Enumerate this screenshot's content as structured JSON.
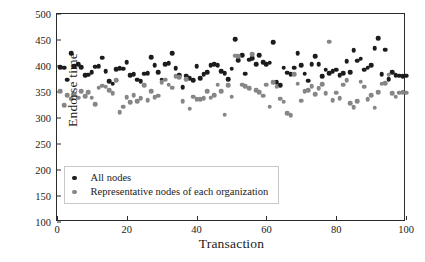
{
  "chart_data": {
    "type": "scatter",
    "title": "",
    "xlabel": "Transaction",
    "ylabel": "Endorse time",
    "xlim": [
      0,
      100
    ],
    "ylim": [
      100,
      500
    ],
    "xticks": [
      0,
      20,
      40,
      60,
      80,
      100
    ],
    "yticks": [
      100,
      150,
      200,
      250,
      300,
      350,
      400,
      450,
      500
    ],
    "grid": false,
    "legend_position": "lower-left-inside",
    "colors": {
      "all_nodes": "#1c1c1c",
      "representative_nodes": "#868686",
      "axis": "#2b2b2b",
      "background": "#ffffff"
    },
    "series": [
      {
        "name": "All nodes",
        "marker": "circle",
        "color": "#1c1c1c",
        "x": [
          1,
          2,
          3,
          4,
          5,
          6,
          7,
          8,
          9,
          10,
          11,
          12,
          13,
          14,
          15,
          16,
          17,
          18,
          19,
          20,
          21,
          22,
          23,
          24,
          25,
          26,
          27,
          28,
          29,
          30,
          31,
          32,
          33,
          34,
          35,
          36,
          37,
          38,
          39,
          40,
          41,
          42,
          43,
          44,
          45,
          46,
          47,
          48,
          49,
          50,
          51,
          52,
          53,
          54,
          55,
          56,
          57,
          58,
          59,
          60,
          61,
          62,
          63,
          64,
          65,
          66,
          67,
          68,
          69,
          70,
          71,
          72,
          73,
          74,
          75,
          76,
          77,
          78,
          79,
          80,
          81,
          82,
          83,
          84,
          85,
          86,
          87,
          88,
          89,
          90,
          91,
          92,
          93,
          94,
          95,
          96,
          97,
          98,
          99,
          100
        ],
        "y": [
          398,
          397,
          374,
          425,
          400,
          403,
          398,
          382,
          383,
          388,
          399,
          400,
          416,
          390,
          371,
          366,
          394,
          396,
          395,
          407,
          382,
          384,
          374,
          371,
          385,
          386,
          417,
          402,
          388,
          374,
          404,
          405,
          425,
          396,
          382,
          359,
          381,
          377,
          373,
          400,
          377,
          384,
          388,
          402,
          404,
          401,
          390,
          386,
          375,
          395,
          451,
          411,
          421,
          385,
          412,
          415,
          404,
          421,
          407,
          404,
          406,
          446,
          369,
          363,
          397,
          387,
          384,
          397,
          425,
          401,
          385,
          372,
          403,
          419,
          404,
          380,
          393,
          386,
          390,
          393,
          382,
          386,
          409,
          388,
          430,
          410,
          414,
          393,
          397,
          401,
          434,
          453,
          384,
          431,
          375,
          388,
          382,
          381,
          380,
          381
        ]
      },
      {
        "name": "Representative nodes of each organization",
        "marker": "circle",
        "color": "#868686",
        "x": [
          1,
          2,
          3,
          4,
          5,
          6,
          7,
          8,
          9,
          10,
          11,
          12,
          13,
          14,
          15,
          16,
          17,
          18,
          19,
          20,
          21,
          22,
          23,
          24,
          25,
          26,
          27,
          28,
          29,
          30,
          31,
          32,
          33,
          34,
          35,
          36,
          37,
          38,
          39,
          40,
          41,
          42,
          43,
          44,
          45,
          46,
          47,
          48,
          49,
          50,
          51,
          52,
          53,
          54,
          55,
          56,
          57,
          58,
          59,
          60,
          61,
          62,
          63,
          64,
          65,
          66,
          67,
          68,
          69,
          70,
          71,
          72,
          73,
          74,
          75,
          76,
          77,
          78,
          79,
          80,
          81,
          82,
          83,
          84,
          85,
          86,
          87,
          88,
          89,
          90,
          91,
          92,
          93,
          94,
          95,
          96,
          97,
          98,
          99,
          100
        ],
        "y": [
          352,
          325,
          344,
          337,
          347,
          339,
          352,
          342,
          350,
          339,
          327,
          358,
          362,
          360,
          354,
          348,
          373,
          311,
          322,
          340,
          330,
          344,
          332,
          338,
          363,
          334,
          351,
          340,
          343,
          369,
          374,
          364,
          358,
          380,
          378,
          332,
          375,
          318,
          341,
          336,
          336,
          338,
          351,
          339,
          344,
          364,
          352,
          306,
          363,
          341,
          420,
          419,
          364,
          361,
          357,
          423,
          353,
          350,
          343,
          364,
          322,
          369,
          360,
          337,
          331,
          309,
          305,
          384,
          366,
          333,
          352,
          354,
          361,
          346,
          357,
          365,
          348,
          447,
          334,
          349,
          338,
          364,
          373,
          329,
          321,
          332,
          370,
          360,
          336,
          344,
          320,
          350,
          366,
          367,
          383,
          348,
          341,
          349,
          350,
          349
        ]
      }
    ]
  },
  "axes": {
    "y_label": "Endorse time",
    "x_label": "Transaction",
    "y_tick_labels": [
      "500",
      "450",
      "400",
      "350",
      "300",
      "250",
      "200",
      "150",
      "100"
    ],
    "x_tick_labels": [
      "0",
      "20",
      "40",
      "60",
      "80",
      "100"
    ]
  },
  "legend": {
    "items": [
      {
        "label": "All nodes",
        "color": "#1c1c1c"
      },
      {
        "label": "Representative nodes of each organization",
        "color": "#868686"
      }
    ]
  }
}
